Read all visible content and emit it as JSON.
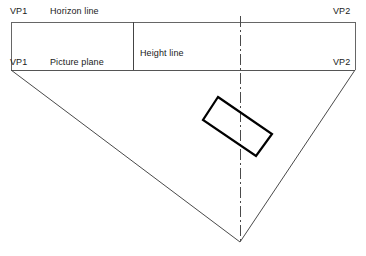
{
  "diagram": {
    "type": "two-point-perspective-construction",
    "background_color": "#ffffff",
    "line_color": "#555555",
    "object_line_color": "#000000",
    "labels": {
      "vp1_horizon": "VP1",
      "horizon_line": "Horizon line",
      "vp2_horizon": "VP2",
      "vp1_picture": "VP1",
      "picture_plane": "Picture plane",
      "vp2_picture": "VP2",
      "height_line": "Height line"
    },
    "geometry": {
      "horizon_line": {
        "x1": 11,
        "y1": 22,
        "x2": 355,
        "y2": 22
      },
      "picture_plane": {
        "x1": 11,
        "y1": 70,
        "x2": 355,
        "y2": 70
      },
      "left_vertical": {
        "x1": 11,
        "y1": 22,
        "x2": 11,
        "y2": 70
      },
      "right_vertical": {
        "x1": 355,
        "y1": 22,
        "x2": 355,
        "y2": 70
      },
      "height_line": {
        "x1": 133,
        "y1": 22,
        "x2": 133,
        "y2": 70
      },
      "center_line": {
        "x1": 240,
        "y1": 16,
        "x2": 240,
        "y2": 242,
        "style": "dash-dot"
      },
      "left_sight_line": {
        "x1": 11,
        "y1": 70,
        "x2": 240,
        "y2": 242
      },
      "right_sight_line": {
        "x1": 355,
        "y1": 70,
        "x2": 240,
        "y2": 242
      },
      "station_point": {
        "x": 240,
        "y": 242
      },
      "plan_rectangle": {
        "corners": [
          {
            "x": 218,
            "y": 97
          },
          {
            "x": 272,
            "y": 134
          },
          {
            "x": 256,
            "y": 156
          },
          {
            "x": 203,
            "y": 120
          }
        ],
        "stroke_width": 2.2
      }
    }
  }
}
